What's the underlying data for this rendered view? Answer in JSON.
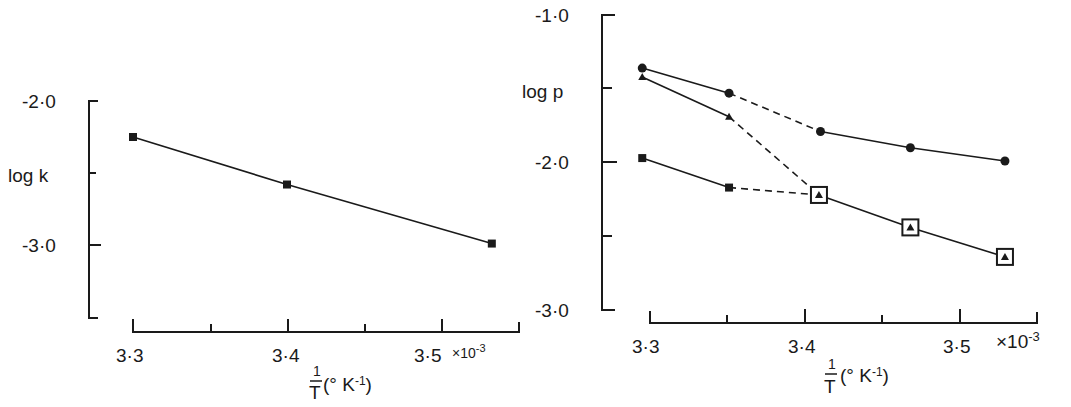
{
  "chart_data": [
    {
      "type": "line",
      "title": "",
      "xlabel": "1/T (°K⁻¹)",
      "ylabel": "log k",
      "x_multiplier_label": "×10⁻³",
      "xlim": [
        3.3,
        3.55
      ],
      "ylim": [
        -3.5,
        -2.0
      ],
      "x_ticks": [
        3.3,
        3.35,
        3.4,
        3.45,
        3.5,
        3.55
      ],
      "x_tick_labels": [
        "3·3",
        "",
        "3·4",
        "",
        "3·5",
        ""
      ],
      "y_ticks": [
        -2.0,
        -2.5,
        -3.0,
        -3.5
      ],
      "y_tick_labels": [
        "-2·0",
        "",
        "-3·0",
        ""
      ],
      "grid": false,
      "series": [
        {
          "name": "k",
          "marker": "filled-square",
          "style": "solid",
          "x": [
            3.3,
            3.4,
            3.533
          ],
          "y": [
            -2.25,
            -2.58,
            -2.99
          ]
        }
      ]
    },
    {
      "type": "line",
      "title": "",
      "xlabel": "1/T (°K⁻¹)",
      "ylabel": "log p",
      "x_multiplier_label": "×10⁻³",
      "xlim": [
        3.3,
        3.55
      ],
      "ylim": [
        -3.0,
        -1.0
      ],
      "x_ticks": [
        3.3,
        3.35,
        3.4,
        3.45,
        3.5,
        3.55
      ],
      "x_tick_labels": [
        "3·3",
        "",
        "3·4",
        "",
        "3·5",
        ""
      ],
      "y_ticks": [
        -1.0,
        -1.5,
        -2.0,
        -2.5,
        -3.0
      ],
      "y_tick_labels": [
        "-1·0",
        "",
        "-2·0",
        "",
        "-3·0"
      ],
      "grid": false,
      "series": [
        {
          "name": "circles",
          "marker": "filled-circle",
          "x": [
            3.295,
            3.351,
            3.41,
            3.468,
            3.529
          ],
          "y": [
            -1.36,
            -1.53,
            -1.79,
            -1.9,
            -1.99
          ],
          "segment_styles": [
            "solid",
            "dashed",
            "solid",
            "solid"
          ]
        },
        {
          "name": "triangles",
          "marker": "filled-triangle",
          "x": [
            3.295,
            3.351,
            3.409,
            3.468,
            3.529
          ],
          "y": [
            -1.42,
            -1.69,
            -2.22,
            -2.44,
            -2.64
          ],
          "segment_styles": [
            "solid",
            "dashed",
            "solid",
            "solid"
          ],
          "boxed_from_index": 2
        },
        {
          "name": "squares",
          "marker": "filled-square",
          "x": [
            3.295,
            3.351,
            3.409
          ],
          "y": [
            -1.97,
            -2.17,
            -2.22
          ],
          "segment_styles": [
            "solid",
            "dashed"
          ]
        }
      ]
    }
  ],
  "labels": {
    "left_ylabel": "log k",
    "right_ylabel": "log p",
    "left_y_ticks": [
      "-2·0",
      "-3·0"
    ],
    "right_y_ticks": [
      "-1·0",
      "-2·0",
      "-3·0"
    ],
    "x_ticks": [
      "3·3",
      "3·4",
      "3·5"
    ],
    "x_multiplier": "×10",
    "x_multiplier_exp": "-3",
    "xlabel_num": "1",
    "xlabel_den": "T",
    "xlabel_unit_open": "(° K",
    "xlabel_unit_exp": "-1",
    "xlabel_unit_close": ")"
  }
}
